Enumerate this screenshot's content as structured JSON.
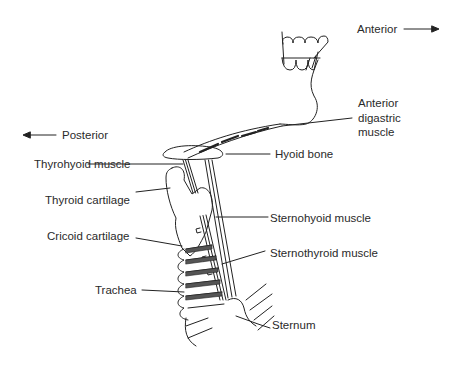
{
  "directions": {
    "anterior": "Anterior",
    "posterior": "Posterior"
  },
  "labels": {
    "anterior_digastric_1": "Anterior",
    "anterior_digastric_2": "digastric",
    "anterior_digastric_3": "muscle",
    "hyoid_bone": "Hyoid bone",
    "thyrohyoid_muscle": "Thyrohyoid muscle",
    "thyroid_cartilage": "Thyroid cartilage",
    "sternohyoid_muscle": "Sternohyoid muscle",
    "cricoid_cartilage": "Cricoid cartilage",
    "sternothyroid_muscle": "Sternothyroid muscle",
    "trachea": "Trachea",
    "sternum": "Sternum"
  },
  "colors": {
    "ink": "#222222",
    "background": "#ffffff"
  }
}
